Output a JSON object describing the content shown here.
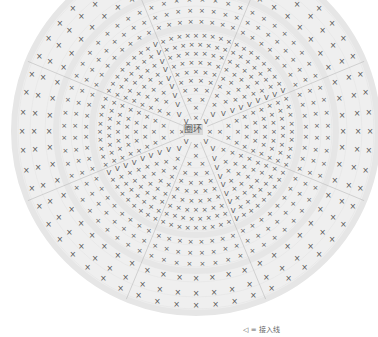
{
  "diagram": {
    "type": "crochet-round-chart",
    "center_label": "圈环",
    "colors": {
      "background": "#ffffff",
      "circle_fill": "#efefef",
      "ring_band": "#e6e6e6",
      "stitch": "#555555",
      "divider": "#b0b0b0"
    },
    "geometry": {
      "cx": 196,
      "cy": 131,
      "r": 182
    },
    "sectors": 8,
    "rounds": [
      {
        "r": 14,
        "stitch": "x",
        "count_per_sector": 1
      },
      {
        "r": 24,
        "stitch": "x",
        "count_per_sector": 1
      },
      {
        "r": 33,
        "stitch": "x",
        "count_per_sector": 2
      },
      {
        "r": 42,
        "stitch": "x",
        "count_per_sector": 3
      },
      {
        "r": 51,
        "stitch": "x",
        "count_per_sector": 4
      },
      {
        "r": 60,
        "stitch": "x",
        "count_per_sector": 5
      },
      {
        "r": 69,
        "stitch": "x",
        "count_per_sector": 6
      },
      {
        "r": 78,
        "stitch": "x",
        "count_per_sector": 7
      },
      {
        "r": 87,
        "stitch": "x",
        "count_per_sector": 8
      },
      {
        "r": 96,
        "stitch": "x",
        "count_per_sector": 9
      },
      {
        "r": 110,
        "stitch": "x",
        "count_per_sector": 8
      },
      {
        "r": 121,
        "stitch": "x",
        "count_per_sector": 8
      },
      {
        "r": 132,
        "stitch": "x",
        "count_per_sector": 8
      },
      {
        "r": 147,
        "stitch": "x",
        "count_per_sector": 7
      },
      {
        "r": 162,
        "stitch": "x",
        "count_per_sector": 7
      },
      {
        "r": 174,
        "stitch": "x",
        "count_per_sector": 7
      }
    ],
    "symbols": {
      "single_crochet": "×",
      "increase": "V",
      "decrease": "Λ",
      "join": "◁"
    }
  },
  "legend": {
    "symbol": "◁",
    "text": "= 接入线"
  }
}
